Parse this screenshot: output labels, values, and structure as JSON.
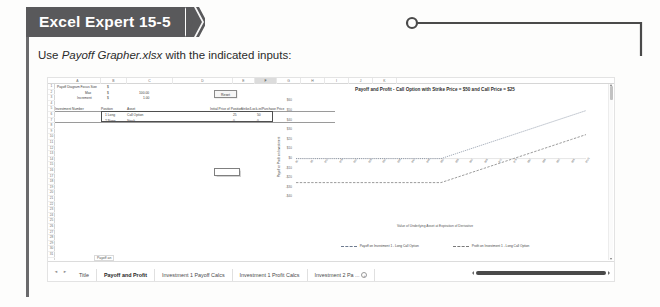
{
  "banner": {
    "title": "Excel Expert 15-5",
    "bg_color": "#59595b"
  },
  "instruction": {
    "prefix": "Use ",
    "filename": "Payoff Grapher.xlsx",
    "suffix": " with the indicated inputs:"
  },
  "spreadsheet": {
    "column_headers": [
      "A",
      "B",
      "C",
      "D",
      "E",
      "F",
      "G",
      "H",
      "I",
      "J",
      "K"
    ],
    "selected_column": "F",
    "row_headers": [
      "1",
      "2",
      "3",
      "4",
      "5",
      "6",
      "7",
      "8",
      "9",
      "10",
      "11",
      "12",
      "13",
      "14",
      "15",
      "16",
      "17",
      "18",
      "19",
      "20",
      "21",
      "22",
      "23",
      "24",
      "25",
      "26",
      "27",
      "28",
      "29",
      "30",
      "31"
    ],
    "cells": [
      {
        "text": "Payoff Diagram Focus Size",
        "col": "A",
        "row": 1
      },
      {
        "text": "$",
        "col": "B",
        "row": 1
      },
      {
        "text": "Max",
        "col": "B",
        "row": 2
      },
      {
        "text": "$",
        "col": "B2",
        "row": 2
      },
      {
        "text": "100.00",
        "col": "C",
        "row": 2
      },
      {
        "text": "Increment",
        "col": "B",
        "row": 3
      },
      {
        "text": "$",
        "col": "B3",
        "row": 3
      },
      {
        "text": "1.00",
        "col": "C",
        "row": 3
      },
      {
        "text": "Investment Number",
        "col": "A",
        "row": 5
      },
      {
        "text": "Position",
        "col": "B",
        "row": 5
      },
      {
        "text": "Asset",
        "col": "C",
        "row": 5
      },
      {
        "text": "Initial Price of Position",
        "col": "E",
        "row": 5
      },
      {
        "text": "Strike/Lock-in/Purchase Price",
        "col": "F",
        "row": 5
      },
      {
        "text": "1 Long",
        "col": "A",
        "row": 6
      },
      {
        "text": "Call Option",
        "col": "C",
        "row": 6
      },
      {
        "text": "25",
        "col": "E",
        "row": 6
      },
      {
        "text": "50",
        "col": "F",
        "row": 6
      },
      {
        "text": "2 None",
        "col": "A",
        "row": 7
      },
      {
        "text": "Stock",
        "col": "C",
        "row": 7
      },
      {
        "text": "0",
        "col": "E",
        "row": 7
      },
      {
        "text": "0",
        "col": "F",
        "row": 7
      }
    ],
    "reset_button_label": "Reset",
    "selected_cell_value": ""
  },
  "chart_data": {
    "type": "line",
    "title": "Payoff and Profit - Call Option with Strike Price = $50 and Call Price = $25",
    "xlabel": "Value of Underlying Asset at Expiration of Derivative",
    "ylabel": "Payoff or Profit on Investment",
    "grid": false,
    "legend_position": "bottom",
    "ylim": [
      -40,
      60
    ],
    "yticks": [
      "$60",
      "$50",
      "$40",
      "$30",
      "$20",
      "$10",
      "$0",
      "-$10",
      "-$20",
      "-$30",
      "-$40"
    ],
    "ytick_values": [
      60,
      50,
      40,
      30,
      20,
      10,
      0,
      -10,
      -20,
      -30,
      -40
    ],
    "x": [
      0,
      5,
      10,
      15,
      20,
      25,
      30,
      35,
      40,
      45,
      50,
      55,
      60,
      65,
      70,
      75,
      80,
      85,
      90,
      95,
      100
    ],
    "xticks": [
      "$0",
      "$5",
      "$10",
      "$15",
      "$20",
      "$25",
      "$30",
      "$35",
      "$40",
      "$45",
      "$50",
      "$55",
      "$60",
      "$65",
      "$70",
      "$75",
      "$80",
      "$85",
      "$90",
      "$95",
      "$100"
    ],
    "series": [
      {
        "name": "Payoff on Investment 1 - Long Call Option",
        "style": "dotted",
        "color": "#6e7b8f",
        "values": [
          0,
          0,
          0,
          0,
          0,
          0,
          0,
          0,
          0,
          0,
          0,
          5,
          10,
          15,
          20,
          25,
          30,
          35,
          40,
          45,
          50
        ]
      },
      {
        "name": "Profit on Investment 1 - Long Call Option",
        "style": "dashed",
        "color": "#7a7a7a",
        "values": [
          -25,
          -25,
          -25,
          -25,
          -25,
          -25,
          -25,
          -25,
          -25,
          -25,
          -25,
          -20,
          -15,
          -10,
          -5,
          0,
          5,
          10,
          15,
          20,
          25
        ]
      }
    ]
  },
  "tabbar": {
    "nav_prev": "◄",
    "nav_next": "►",
    "tooltip": "Payoff an",
    "tabs": [
      {
        "label": "Title",
        "active": false
      },
      {
        "label": "Payoff and Profit",
        "active": true
      },
      {
        "label": "Investment 1 Payoff Calcs",
        "active": false
      },
      {
        "label": "Investment 1 Profit Calcs",
        "active": false
      },
      {
        "label": "Investment 2 Pa ...",
        "active": false
      }
    ]
  }
}
